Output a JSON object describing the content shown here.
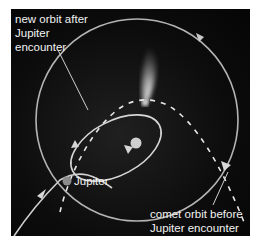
{
  "figure": {
    "type": "orbital-diagram",
    "background_color": "#0a0a0a",
    "line_color": "#b8b8b8"
  },
  "labels": {
    "new_orbit": {
      "line1": "new orbit after",
      "line2": "Jupiter",
      "line3": "encounter"
    },
    "jupiter": "Jupiter",
    "comet_before": {
      "line1": "comet orbit before",
      "line2": "Jupiter encounter"
    }
  },
  "elements": {
    "sun": {
      "color": "#d0d0d0"
    },
    "jupiter_marker": {
      "color": "#8a8a8a"
    },
    "jupiter_orbit": {
      "style": "solid circle"
    },
    "comet_orbit_before": {
      "style": "dashed"
    },
    "comet_orbit_after": {
      "style": "solid ellipse"
    },
    "comet_tail": {
      "color": "#ffffff"
    }
  }
}
